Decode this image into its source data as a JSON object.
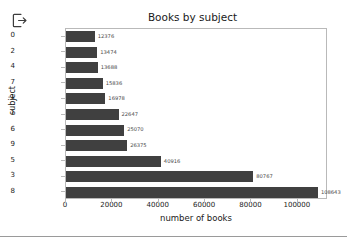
{
  "app": {
    "logout_icon": "logout-icon"
  },
  "chart_data": {
    "type": "bar",
    "orientation": "horizontal",
    "title": "Books by subject",
    "xlabel": "number of books",
    "ylabel": "subject",
    "categories": [
      "0",
      "2",
      "4",
      "7",
      "-1",
      "1",
      "6",
      "9",
      "5",
      "3",
      "8"
    ],
    "values": [
      12376,
      13474,
      13688,
      15836,
      16978,
      22647,
      25070,
      26375,
      40916,
      80767,
      108643
    ],
    "value_labels": [
      "12376",
      "13474",
      "13688",
      "15836",
      "16978",
      "22647",
      "25070",
      "26375",
      "40916",
      "80767",
      "108643"
    ],
    "xticks": [
      0,
      20000,
      40000,
      60000,
      80000,
      100000
    ],
    "xtick_labels": [
      "0",
      "20000",
      "40000",
      "60000",
      "80000",
      "100000"
    ],
    "xlim": [
      0,
      113000
    ],
    "grid": false,
    "legend": null,
    "bar_color": "#404040",
    "frame_color": "#b9b9b9"
  }
}
